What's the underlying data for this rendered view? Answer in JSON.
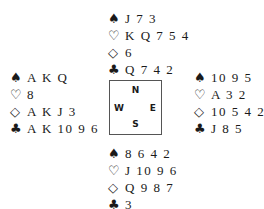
{
  "deal": {
    "north": {
      "spades": "J 7 3",
      "hearts": "K Q 7 5 4",
      "diamonds": "6",
      "clubs": "Q 7 4 2"
    },
    "west": {
      "spades": "A K Q",
      "hearts": "8",
      "diamonds": "A K J 3",
      "clubs": "A K 10 9 6"
    },
    "east": {
      "spades": "10 9 5",
      "hearts": "A 3 2",
      "diamonds": "10 5 4 2",
      "clubs": "J 8 5"
    },
    "south": {
      "spades": "8 6 4 2",
      "hearts": "J 10 9 6",
      "diamonds": "Q 9 8 7",
      "clubs": "3"
    }
  },
  "icons": {
    "spade": "♠",
    "heart": "♡",
    "diamond": "◇",
    "club": "♣"
  },
  "compass": {
    "north": "N",
    "west": "W",
    "east": "E",
    "south": "S"
  }
}
